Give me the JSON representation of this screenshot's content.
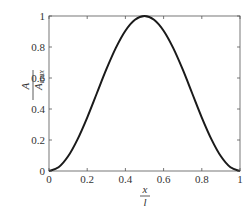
{
  "chart_data": {
    "type": "line",
    "title": "",
    "xlabel": {
      "numerator": "x",
      "denominator": "l"
    },
    "ylabel": {
      "numerator": "A",
      "denominator": "A",
      "denominator_sub": "max"
    },
    "xlim": [
      0,
      1
    ],
    "ylim": [
      0,
      1
    ],
    "xticks": [
      "0",
      "0.2",
      "0.4",
      "0.6",
      "0.8",
      "1"
    ],
    "xtick_values": [
      0,
      0.2,
      0.4,
      0.6,
      0.8,
      1
    ],
    "yticks": [
      "0",
      "0.2",
      "0.4",
      "0.6",
      "0.8",
      "1"
    ],
    "ytick_values": [
      0,
      0.2,
      0.4,
      0.6,
      0.8,
      1
    ],
    "grid": false,
    "legend": null,
    "series": [
      {
        "name": "A/Amax",
        "color": "#1a1a1a",
        "x": [
          0,
          0.05,
          0.1,
          0.15,
          0.2,
          0.25,
          0.3,
          0.35,
          0.4,
          0.45,
          0.5,
          0.55,
          0.6,
          0.65,
          0.7,
          0.75,
          0.8,
          0.85,
          0.9,
          0.95,
          1
        ],
        "y": [
          0,
          0.024,
          0.095,
          0.206,
          0.345,
          0.5,
          0.655,
          0.794,
          0.905,
          0.976,
          1,
          0.976,
          0.905,
          0.794,
          0.655,
          0.5,
          0.345,
          0.206,
          0.095,
          0.024,
          0
        ]
      }
    ]
  }
}
